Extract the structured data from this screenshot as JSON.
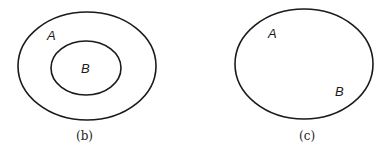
{
  "diagrams": [
    {
      "caption": "(b)",
      "description": "Set B contained entirely within set A",
      "sets": [
        {
          "label": "A",
          "shape": "outer-ellipse"
        },
        {
          "label": "B",
          "shape": "inner-ellipse"
        }
      ]
    },
    {
      "caption": "(c)",
      "description": "A and B are the same set (single ellipse)",
      "sets": [
        {
          "label": "A",
          "shape": "ellipse"
        },
        {
          "label": "B",
          "shape": "ellipse"
        }
      ]
    }
  ],
  "colors": {
    "stroke": "#1a1a1a",
    "background": "#ffffff"
  }
}
